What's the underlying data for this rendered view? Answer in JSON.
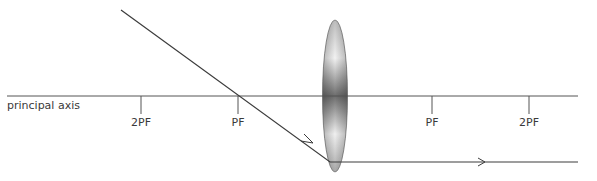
{
  "diagram": {
    "axis_label": "principal axis",
    "ticks": [
      {
        "label": "2PF",
        "x": 141
      },
      {
        "label": "PF",
        "x": 238
      },
      {
        "label": "PF",
        "x": 432
      },
      {
        "label": "2PF",
        "x": 529
      }
    ],
    "colors": {
      "line": "#3c3c3c",
      "axis": "#555555",
      "lens_dark": "#6a6a6a",
      "lens_light": "#f0f0f0"
    }
  }
}
